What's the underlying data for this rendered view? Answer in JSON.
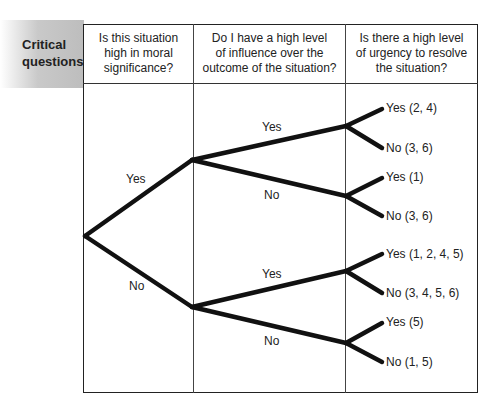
{
  "row_label": "Critical questions",
  "row_label_lines": [
    "Critical",
    "questions"
  ],
  "columns": [
    {
      "header": "Is this situation high in moral significance?",
      "lines": [
        "Is this situation",
        "high in moral",
        "significance?"
      ]
    },
    {
      "header": "Do I have a high level of influence over the outcome of the situation?",
      "lines": [
        "Do I have a high level",
        "of influence over the",
        "outcome of the situation?"
      ]
    },
    {
      "header": "Is there a high level of urgency to resolve the situation?",
      "lines": [
        "Is there a high level",
        "of urgency to resolve",
        "the situation?"
      ]
    }
  ],
  "tree": {
    "level1": {
      "yes": "Yes",
      "no": "No"
    },
    "level2": [
      {
        "parent": "Yes",
        "yes": "Yes",
        "no": "No"
      },
      {
        "parent": "No",
        "yes": "Yes",
        "no": "No"
      }
    ],
    "leaves": [
      "Yes (2, 4)",
      "No (3, 6)",
      "Yes (1)",
      "No (3, 6)",
      "Yes (1, 2, 4, 5)",
      "No (3, 4, 5, 6)",
      "Yes (5)",
      "No (1, 5)"
    ]
  },
  "colors": {
    "line": "#111111",
    "border": "#222222",
    "label_shade": "#bdbdbd"
  }
}
